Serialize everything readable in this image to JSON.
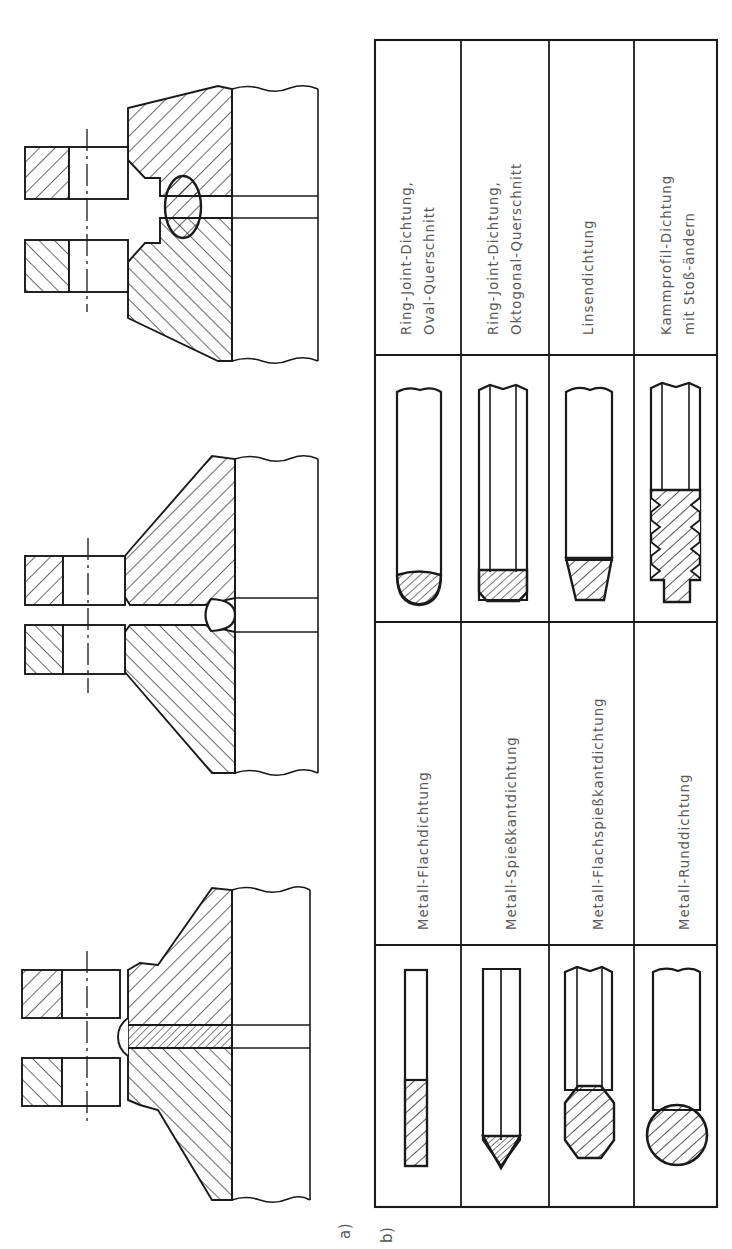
{
  "figure": {
    "orientation": "rotated-90-ccw",
    "background_color": "#ffffff",
    "line_color": "#1a1a1a",
    "text_color": "#585858"
  },
  "parts": {
    "a": {
      "label": "a)",
      "caption": "Flanschverbindungen im Schnitt mit verschiedenen Dichtungen",
      "flanges": [
        {
          "name": "flange-ring-joint-oval",
          "gasket_shape": "oval-ring",
          "position_index": 1
        },
        {
          "name": "flange-lens-gasket",
          "gasket_shape": "lens",
          "position_index": 2
        },
        {
          "name": "flange-flat-gasket",
          "gasket_shape": "flat",
          "position_index": 3
        }
      ]
    },
    "b": {
      "label": "b)",
      "caption": "Dichtungsquerschnitte",
      "table": {
        "rows": 4,
        "columns": 4,
        "column_kinds": [
          "profile",
          "label",
          "profile",
          "label"
        ],
        "entries": [
          {
            "row": 1,
            "left_profile": "metall-flachdichtung-profile",
            "left_label": "Metall-Flachdichtung",
            "right_profile": "ring-joint-oval-profile",
            "right_label_line1": "Ring-Joint-Dichtung,",
            "right_label_line2": "Oval-Querschnitt"
          },
          {
            "row": 2,
            "left_profile": "metall-spiesskantdichtung-profile",
            "left_label": "Metall-Spießkantdichtung",
            "right_profile": "ring-joint-oktogonal-profile",
            "right_label_line1": "Ring-Joint-Dichtung,",
            "right_label_line2": "Oktogonal-Querschnitt"
          },
          {
            "row": 3,
            "left_profile": "metall-flachspiesskantdichtung-profile",
            "left_label": "Metall-Flachspießkantdichtung",
            "right_profile": "linsendichtung-profile",
            "right_label_line1": "Linsendichtung",
            "right_label_line2": ""
          },
          {
            "row": 4,
            "left_profile": "metall-runddichtung-profile",
            "left_label": "Metall-Runddichtung",
            "right_profile": "kammprofil-dichtung-profile",
            "right_label_line1": "Kammprofil-Dichtung",
            "right_label_line2": "mit Stoß-ändern"
          }
        ]
      }
    }
  }
}
